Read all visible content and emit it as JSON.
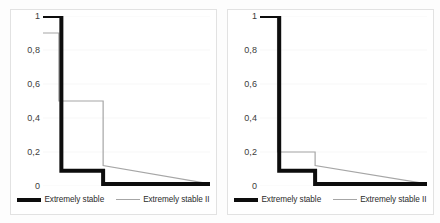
{
  "figure": {
    "background": "#fdfdfd",
    "panel_border_color": "#e2e2e2",
    "series_colors": {
      "extremely_stable": "#0d0d0d",
      "extremely_stable_ii": "#a6a6a6"
    },
    "gridline_color": "#ededed"
  },
  "legend": {
    "series_1_label": "Extremely stable",
    "series_2_label": "Extremely stable II"
  },
  "chart_data": [
    {
      "id": "left-chart",
      "type": "line",
      "step": "post",
      "title": "",
      "xlabel": "",
      "ylabel": "",
      "ylim": [
        0,
        1
      ],
      "xlim": [
        0,
        1
      ],
      "yticks": [
        1,
        0.8,
        0.6,
        0.4,
        0.2,
        0
      ],
      "ytick_labels": [
        "1",
        "0,8",
        "0,6",
        "0,4",
        "0,2",
        "0"
      ],
      "grid": true,
      "legend_position": "bottom",
      "series": [
        {
          "name": "Extremely stable",
          "color": "#0d0d0d",
          "linewidth": 4,
          "x": [
            0.0,
            0.11,
            0.11,
            0.36,
            0.36,
            1.0
          ],
          "y": [
            1.0,
            1.0,
            0.09,
            0.09,
            0.012,
            0.012
          ]
        },
        {
          "name": "Extremely stable II",
          "color": "#a6a6a6",
          "linewidth": 1.2,
          "x": [
            0.0,
            0.095,
            0.095,
            0.36,
            0.36,
            1.0
          ],
          "y": [
            0.9,
            0.9,
            0.5,
            0.5,
            0.12,
            0.012
          ]
        }
      ]
    },
    {
      "id": "right-chart",
      "type": "line",
      "step": "post",
      "title": "",
      "xlabel": "",
      "ylabel": "",
      "ylim": [
        0,
        1
      ],
      "xlim": [
        0,
        1
      ],
      "yticks": [
        1,
        0.8,
        0.6,
        0.4,
        0.2,
        0
      ],
      "ytick_labels": [
        "1",
        "0,8",
        "0,6",
        "0,4",
        "0,2",
        "0"
      ],
      "grid": true,
      "legend_position": "bottom",
      "series": [
        {
          "name": "Extremely stable",
          "color": "#0d0d0d",
          "linewidth": 4,
          "x": [
            0.0,
            0.115,
            0.115,
            0.33,
            0.33,
            1.0
          ],
          "y": [
            1.0,
            1.0,
            0.09,
            0.09,
            0.012,
            0.012
          ]
        },
        {
          "name": "Extremely stable II",
          "color": "#a6a6a6",
          "linewidth": 1.2,
          "x": [
            0.0,
            0.105,
            0.105,
            0.33,
            0.33,
            1.0
          ],
          "y": [
            1.0,
            1.0,
            0.2,
            0.2,
            0.12,
            0.012
          ]
        }
      ]
    }
  ]
}
